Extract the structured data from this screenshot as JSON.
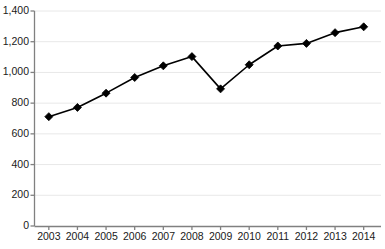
{
  "chart_data": {
    "type": "line",
    "title": "",
    "subtitle": "",
    "xlabel": "",
    "ylabel": "",
    "categories": [
      "2003",
      "2004",
      "2005",
      "2006",
      "2007",
      "2008",
      "2009",
      "2010",
      "2011",
      "2012",
      "2013",
      "2014"
    ],
    "values": [
      712,
      772,
      865,
      967,
      1043,
      1103,
      893,
      1050,
      1172,
      1189,
      1259,
      1297
    ],
    "series": [
      {
        "name": "",
        "values": [
          712,
          772,
          865,
          967,
          1043,
          1103,
          893,
          1050,
          1172,
          1189,
          1259,
          1297
        ]
      }
    ],
    "ylim": [
      0,
      1400
    ],
    "ytick_values": [
      0,
      200,
      400,
      600,
      800,
      1000,
      1200,
      1400
    ],
    "ytick_labels": [
      "0",
      "200",
      "400",
      "600",
      "800",
      "1,000",
      "1,200",
      "1,400"
    ],
    "xtick_labels": [
      "2003",
      "2004",
      "2005",
      "2006",
      "2007",
      "2008",
      "2009",
      "2010",
      "2011",
      "2012",
      "2013",
      "2014"
    ],
    "grid": "horizontal",
    "legend": "none",
    "marker": "diamond",
    "annotations": [],
    "colors": {
      "line": "#000000",
      "marker": "#000000",
      "grid": "#e8e8e8",
      "axis": "#808080",
      "text": "#1a1a1a",
      "background": "#ffffff"
    }
  }
}
